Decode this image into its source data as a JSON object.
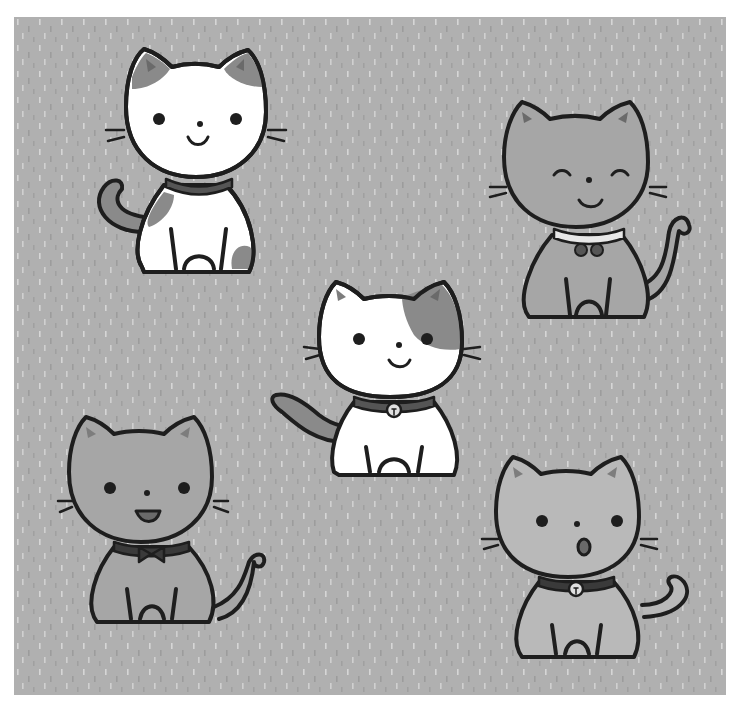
{
  "illustration": {
    "subject": "Five cartoon kittens sitting on a dotted background",
    "colors": {
      "background": "#b0b0b0",
      "dash_light": "#d4d4d4",
      "dash_dark": "#9a9a9a",
      "outline": "#1e1e1e",
      "white_fur": "#ffffff",
      "patch": "#8a8a8a",
      "gray_fur": "#a6a6a6",
      "light_gray_fur": "#b9b9b9",
      "collar": "#555555",
      "inner_ear": "#7d7d7d"
    },
    "cats": [
      {
        "name": "calico-cat-top-left",
        "fur": "white with gray patches",
        "expression": "smile",
        "accessory": "plain collar"
      },
      {
        "name": "gray-cat-top-right",
        "fur": "gray",
        "expression": "happy closed eyes",
        "accessory": "white collar with pom-poms"
      },
      {
        "name": "patched-cat-center",
        "fur": "white with gray patch on head",
        "expression": "smile",
        "accessory": "collar with bell"
      },
      {
        "name": "gray-cat-bottom-left",
        "fur": "gray",
        "expression": "open smile",
        "accessory": "bow tie collar"
      },
      {
        "name": "gray-cat-bottom-right",
        "fur": "light gray",
        "expression": "surprised",
        "accessory": "collar with bell"
      }
    ]
  }
}
